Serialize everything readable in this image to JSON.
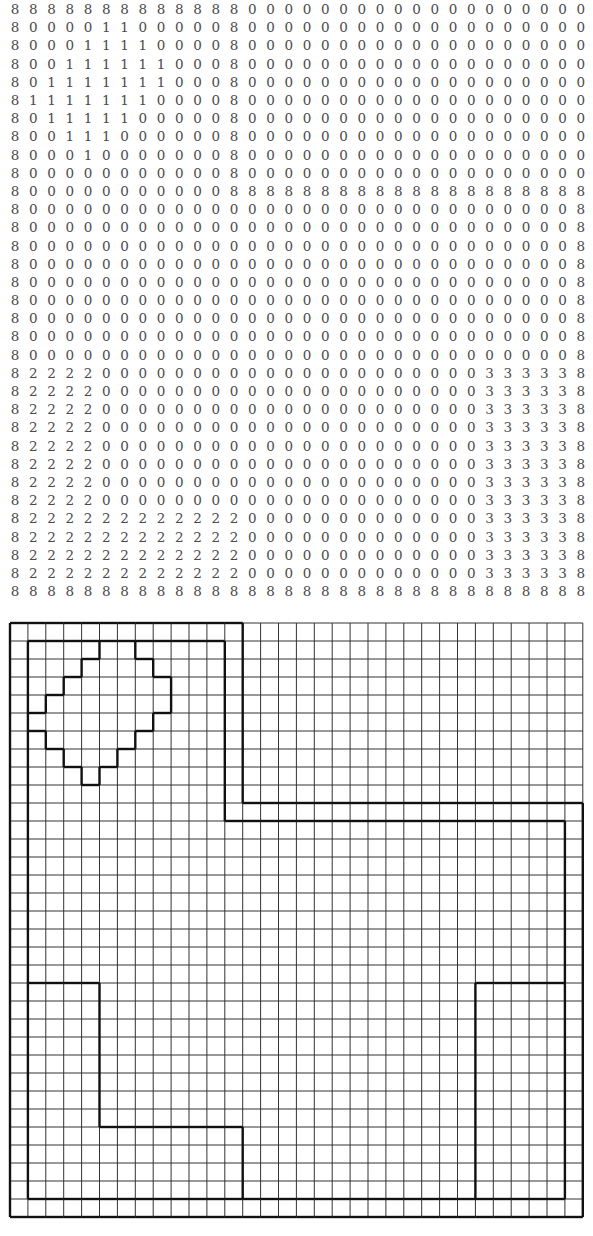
{
  "figure": {
    "rows": 33,
    "cols": 32,
    "matrix": [
      "88888888888880000000000000000000",
      "80000110000080000000000000000000",
      "80001111000080000000000000000000",
      "80011111100080000000000000000000",
      "80111111100080000000000000000000",
      "81111111000080000000000000000000",
      "80111110000080000000000000000000",
      "80011100000080000000000000000000",
      "80001000000080000000000000000000",
      "80000000000080000000000000000000",
      "80000000000088888888888888888888",
      "80000000000000000000000000000008",
      "80000000000000000000000000000008",
      "80000000000000000000000000000008",
      "80000000000000000000000000000008",
      "80000000000000000000000000000008",
      "80000000000000000000000000000008",
      "80000000000000000000000000000008",
      "80000000000000000000000000000008",
      "80000000000000000000000000000008",
      "82222000000000000000000000333338",
      "82222000000000000000000000333338",
      "82222000000000000000000000333338",
      "82222000000000000000000000333338",
      "82222000000000000000000000333338",
      "82222000000000000000000000333338",
      "82222000000000000000000000333338",
      "82222000000000000000000000333338",
      "82222222222220000000000000333338",
      "82222222222220000000000000333338",
      "82222222222220000000000000333338",
      "82222222222220000000000000333338",
      "88888888888888888888888888888888"
    ],
    "labels": {
      "0": "background",
      "1": "diamond region",
      "2": "L-shaped region",
      "3": "rectangle region",
      "8": "boundary"
    },
    "colors": {
      "text": "#4a4a4a",
      "grid_line": "#333333",
      "outline": "#111111"
    }
  }
}
